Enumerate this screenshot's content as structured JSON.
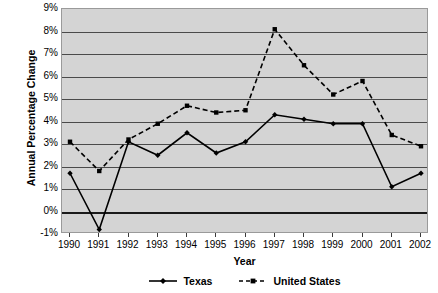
{
  "chart_data": {
    "type": "line",
    "title": "",
    "xlabel": "Year",
    "ylabel": "Annual Percentage Change",
    "categories": [
      "1990",
      "1991",
      "1992",
      "1993",
      "1994",
      "1995",
      "1996",
      "1997",
      "1998",
      "1999",
      "2000",
      "2001",
      "2002"
    ],
    "x": [
      1990,
      1991,
      1992,
      1993,
      1994,
      1995,
      1996,
      1997,
      1998,
      1999,
      2000,
      2001,
      2002
    ],
    "ylim": [
      -1,
      9
    ],
    "ytick_labels": [
      "9%",
      "8%",
      "7%",
      "6%",
      "5%",
      "4%",
      "3%",
      "2%",
      "1%",
      "0%",
      "-1%"
    ],
    "ytick_values": [
      9,
      8,
      7,
      6,
      5,
      4,
      3,
      2,
      1,
      0,
      -1
    ],
    "grid": true,
    "legend_position": "bottom",
    "series": [
      {
        "name": "Texas",
        "style": "solid",
        "marker": "diamond",
        "color": "#000000",
        "values": [
          1.7,
          -0.8,
          3.1,
          2.5,
          3.5,
          2.6,
          3.1,
          4.3,
          4.1,
          3.9,
          3.9,
          1.1,
          1.7
        ]
      },
      {
        "name": "United States",
        "style": "dashed",
        "marker": "square",
        "color": "#000000",
        "values": [
          3.1,
          1.8,
          3.2,
          3.9,
          4.7,
          4.4,
          4.5,
          8.1,
          6.5,
          5.2,
          5.8,
          3.4,
          2.9
        ]
      }
    ]
  },
  "legend": {
    "entries": [
      {
        "label": "Texas"
      },
      {
        "label": "United States"
      }
    ]
  },
  "colors": {
    "plot_background": "#d4d4d4",
    "gridline": "#4a4a4a",
    "zero_line": "#1a1a1a",
    "series": "#000000"
  }
}
